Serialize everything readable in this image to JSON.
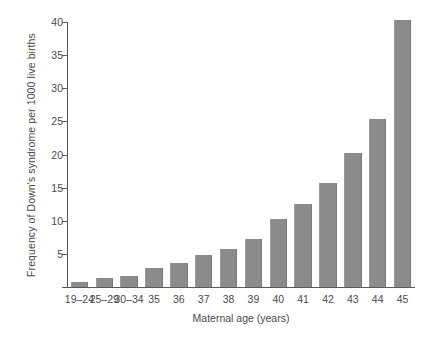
{
  "chart_data": {
    "type": "bar",
    "title": "",
    "subtitle": "",
    "xlabel": "Maternal age (years)",
    "ylabel": "Frequency of Down's syndrome per 1000 live births",
    "categories": [
      "19–24",
      "25–29",
      "30–34",
      "35",
      "36",
      "37",
      "38",
      "39",
      "40",
      "41",
      "42",
      "43",
      "44",
      "45"
    ],
    "values": [
      0.8,
      1.3,
      1.7,
      2.9,
      3.7,
      4.9,
      5.8,
      7.2,
      10.3,
      12.5,
      15.7,
      20.3,
      25.3,
      40.3
    ],
    "ylim": [
      0,
      40
    ],
    "yticks": [
      0,
      5,
      10,
      15,
      20,
      25,
      30,
      35,
      40
    ],
    "ytick_labels": [
      "",
      "5",
      "10",
      "15",
      "20",
      "25",
      "30",
      "35",
      "40"
    ],
    "grid": false,
    "legend": null,
    "bar_color": "#8b8b8b",
    "axis_color": "#5a5a5a",
    "background_color": "#ffffff",
    "annotations": []
  }
}
